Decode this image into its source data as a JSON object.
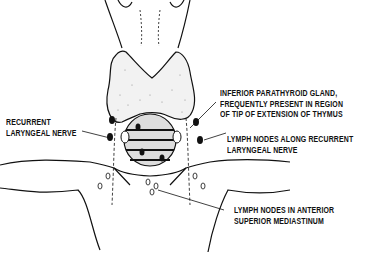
{
  "diagram": {
    "labels": {
      "recurrent_laryngeal_nerve": [
        "RECURRENT",
        "LARYNGEAL NERVE"
      ],
      "inferior_parathyroid": [
        "INFERIOR PARATHYROID GLAND,",
        "FREQUENTLY PRESENT IN REGION",
        "OF TIP OF EXTENSION OF THYMUS"
      ],
      "lymph_nodes_recurrent": [
        "LYMPH NODES ALONG RECURRENT",
        "LARYNGEAL NERVE"
      ],
      "lymph_nodes_mediastinum": [
        "LYMPH NODES IN ANTERIOR",
        "SUPERIOR MEDIASTINUM"
      ]
    },
    "colors": {
      "ink": "#111111",
      "background": "#ffffff",
      "gland_fill": "#f2f2f2"
    }
  }
}
